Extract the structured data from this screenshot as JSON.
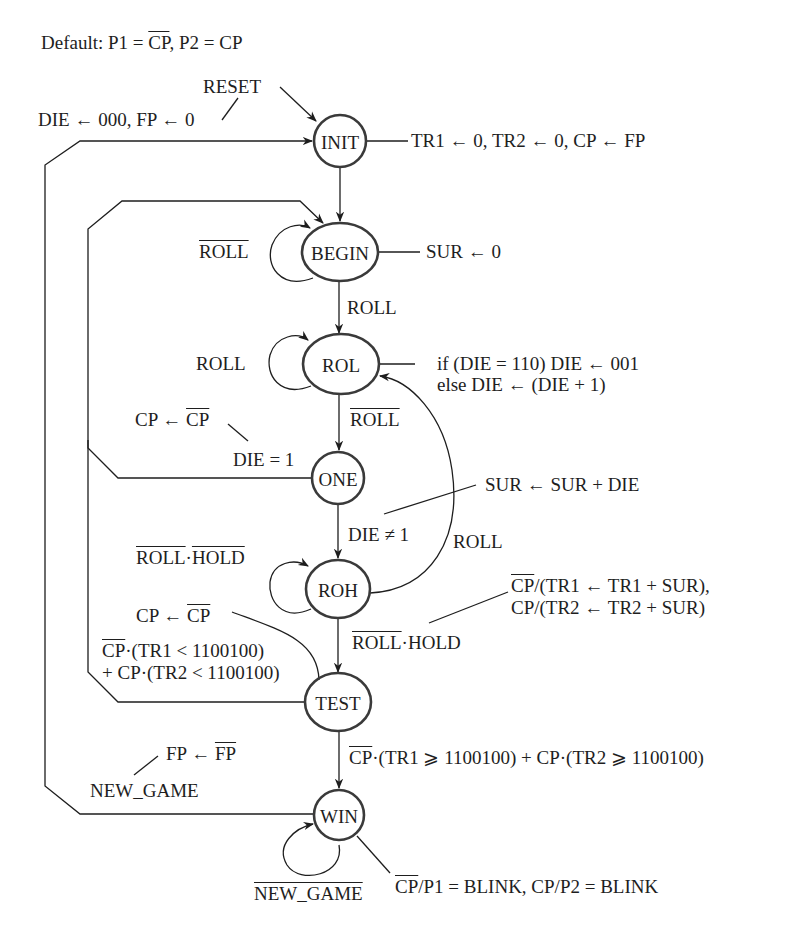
{
  "header": {
    "default_prefix": "Default: P1 = ",
    "default_cp_bar": "CP",
    "default_suffix": ", P2 = CP"
  },
  "states": [
    {
      "name": "INIT"
    },
    {
      "name": "BEGIN"
    },
    {
      "name": "ROL"
    },
    {
      "name": "ONE"
    },
    {
      "name": "ROH"
    },
    {
      "name": "TEST"
    },
    {
      "name": "WIN"
    }
  ],
  "labels": {
    "reset": "RESET",
    "reset_action": "DIE ← 000, FP ← 0",
    "init_action": "TR1 ← 0, TR2 ← 0, CP ← FP",
    "begin_self_loop": "ROLL",
    "begin_action": "SUR ← 0",
    "begin_to_rol": "ROLL",
    "rol_self_loop": "ROLL",
    "rol_action_line1": "if (DIE = 110) DIE ← 001",
    "rol_action_line2": "else DIE ← (DIE + 1)",
    "rol_to_one": "ROLL",
    "one_action_prefix": "CP ← ",
    "one_action_bar": "CP",
    "one_to_begin": "DIE = 1",
    "one_to_roh": "DIE ≠ 1",
    "one_to_roh_action": "SUR ← SUR + DIE",
    "roh_to_rol": "ROLL",
    "roh_self_loop_a": "ROLL",
    "roh_self_loop_dot": "·",
    "roh_self_loop_b": "HOLD",
    "roh_to_test_bar": "ROLL",
    "roh_to_test_rest": "·HOLD",
    "roh_action_line1_bar": "CP",
    "roh_action_line1_rest": "/(TR1 ← TR1 + SUR),",
    "roh_action_line2": "CP/(TR2 ← TR2 + SUR)",
    "test_action_prefix": "CP ← ",
    "test_action_bar": "CP",
    "test_to_begin_line1_bar": "CP",
    "test_to_begin_line1_rest": "·(TR1 < 1100100)",
    "test_to_begin_line2": "+ CP·(TR2 < 1100100)",
    "test_to_win_bar": "CP",
    "test_to_win_rest": "·(TR1 ⩾ 1100100) + CP·(TR2 ⩾ 1100100)",
    "win_to_init_action_prefix": "FP ← ",
    "win_to_init_action_bar": "FP",
    "win_to_init": "NEW_GAME",
    "win_self_loop": "NEW_GAME",
    "win_action_bar": "CP",
    "win_action_rest": "/P1 = BLINK, CP/P2 = BLINK"
  },
  "colors": {
    "ink": "#1e1e1e",
    "background": "#ffffff"
  }
}
